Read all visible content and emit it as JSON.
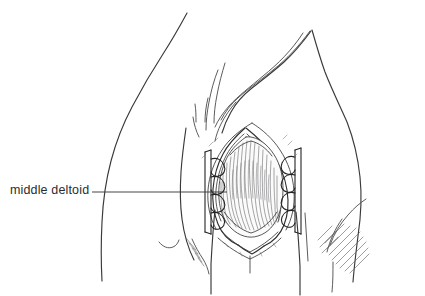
{
  "figure": {
    "background_color": "#ffffff",
    "ink_color": "#2b2b2b",
    "width": 425,
    "height": 296
  },
  "annotations": [
    {
      "id": "middle-deltoid",
      "label": "middle deltoid",
      "leader_line": {
        "x1": 92,
        "y1": 192,
        "x2": 227,
        "y2": 192
      },
      "label_position": {
        "x": 10,
        "y": 184
      }
    }
  ],
  "anatomy": {
    "regions": [
      {
        "name": "neck-and-trapezius-contour"
      },
      {
        "name": "clavicle-and-acromion-folds"
      },
      {
        "name": "shoulder-outline"
      },
      {
        "name": "chest-and-axilla-contour"
      },
      {
        "name": "upper-arm-outline"
      },
      {
        "name": "deltoid-muscle-belly"
      },
      {
        "name": "skin-incision-edges"
      },
      {
        "name": "subcutaneous-fascia"
      },
      {
        "name": "triceps-shading"
      }
    ],
    "instruments": [
      {
        "name": "left-self-retaining-retractor",
        "prongs": 4
      },
      {
        "name": "right-self-retaining-retractor",
        "prongs": 4
      }
    ]
  }
}
